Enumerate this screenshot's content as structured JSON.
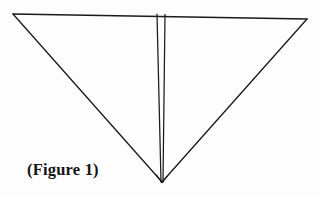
{
  "document": {
    "kind": "scanned-line-drawing",
    "background_color": "#fdfdfd",
    "ink_color": "#1a1a1a",
    "width": 320,
    "height": 197
  },
  "caption": {
    "text": "(Figure 1)",
    "x": 27,
    "y": 160,
    "font_weight": "bold",
    "font_style": "serif",
    "color": "#151515"
  },
  "figure": {
    "stroke_color": "#1a1a1a",
    "stroke_width": 1.3,
    "vertices": {
      "top_left": {
        "x": 13,
        "y": 14
      },
      "top_right": {
        "x": 307,
        "y": 19
      },
      "bottom_apex": {
        "x": 162,
        "y": 182
      }
    },
    "edges": [
      {
        "name": "top-edge",
        "from": {
          "x": 13,
          "y": 14
        },
        "to": {
          "x": 307,
          "y": 19
        }
      },
      {
        "name": "left-edge",
        "from": {
          "x": 13,
          "y": 14
        },
        "to": {
          "x": 162,
          "y": 182
        }
      },
      {
        "name": "right-edge",
        "from": {
          "x": 307,
          "y": 19
        },
        "to": {
          "x": 162,
          "y": 182
        }
      }
    ],
    "interior_lines": [
      {
        "name": "inner-line-left",
        "from": {
          "x": 157,
          "y": 14.2
        },
        "to": {
          "x": 161,
          "y": 182
        }
      },
      {
        "name": "inner-line-right",
        "from": {
          "x": 165,
          "y": 14.4
        },
        "to": {
          "x": 163,
          "y": 182
        }
      }
    ]
  }
}
